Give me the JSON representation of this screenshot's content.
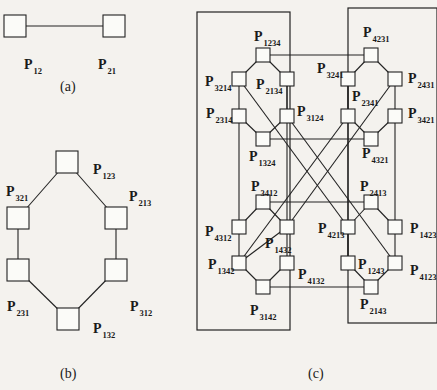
{
  "figure": {
    "panels": [
      {
        "id": "a",
        "caption": "(a)",
        "nodes": [
          {
            "id": "P12",
            "sub": "12",
            "x": 15,
            "y": 26
          },
          {
            "id": "P21",
            "sub": "21",
            "x": 114,
            "y": 26
          }
        ],
        "edges": [
          [
            "P12",
            "P21"
          ]
        ]
      },
      {
        "id": "b",
        "caption": "(b)",
        "nodes": [
          {
            "id": "P123",
            "sub": "123",
            "x": 67,
            "y": 162
          },
          {
            "id": "P321",
            "sub": "321",
            "x": 18,
            "y": 218
          },
          {
            "id": "P213",
            "sub": "213",
            "x": 116,
            "y": 218
          },
          {
            "id": "P231",
            "sub": "231",
            "x": 18,
            "y": 270
          },
          {
            "id": "P312",
            "sub": "312",
            "x": 116,
            "y": 270
          },
          {
            "id": "P132",
            "sub": "132",
            "x": 68,
            "y": 319
          }
        ],
        "edges": [
          [
            "P123",
            "P321"
          ],
          [
            "P123",
            "P213"
          ],
          [
            "P321",
            "P231"
          ],
          [
            "P213",
            "P312"
          ],
          [
            "P231",
            "P132"
          ],
          [
            "P312",
            "P132"
          ]
        ]
      },
      {
        "id": "c",
        "caption": "(c)",
        "nodes": [
          {
            "id": "P1234",
            "sub": "1234",
            "x": 263,
            "y": 55
          },
          {
            "id": "P3214",
            "sub": "3214",
            "x": 239,
            "y": 79
          },
          {
            "id": "P2134",
            "sub": "2134",
            "x": 287,
            "y": 79
          },
          {
            "id": "P2314",
            "sub": "2314",
            "x": 239,
            "y": 116
          },
          {
            "id": "P3124",
            "sub": "3124",
            "x": 287,
            "y": 116
          },
          {
            "id": "P1324",
            "sub": "1324",
            "x": 263,
            "y": 139
          },
          {
            "id": "P4231",
            "sub": "4231",
            "x": 371,
            "y": 55
          },
          {
            "id": "P3241",
            "sub": "3241",
            "x": 348,
            "y": 79
          },
          {
            "id": "P2431",
            "sub": "2431",
            "x": 395,
            "y": 79
          },
          {
            "id": "P2341",
            "sub": "2341",
            "x": 348,
            "y": 116
          },
          {
            "id": "P3421",
            "sub": "3421",
            "x": 395,
            "y": 116
          },
          {
            "id": "P4321",
            "sub": "4321",
            "x": 371,
            "y": 139
          },
          {
            "id": "P3412",
            "sub": "3412",
            "x": 263,
            "y": 202
          },
          {
            "id": "P4312",
            "sub": "4312",
            "x": 239,
            "y": 227
          },
          {
            "id": "P1432",
            "sub": "1432",
            "x": 287,
            "y": 227
          },
          {
            "id": "P1342",
            "sub": "1342",
            "x": 239,
            "y": 263
          },
          {
            "id": "P4132",
            "sub": "4132",
            "x": 287,
            "y": 263
          },
          {
            "id": "P3142",
            "sub": "3142",
            "x": 263,
            "y": 287
          },
          {
            "id": "P2413",
            "sub": "2413",
            "x": 371,
            "y": 202
          },
          {
            "id": "P4213",
            "sub": "4213",
            "x": 348,
            "y": 227
          },
          {
            "id": "P1423",
            "sub": "1423",
            "x": 395,
            "y": 227
          },
          {
            "id": "P1243",
            "sub": "1243",
            "x": 348,
            "y": 263
          },
          {
            "id": "P4123",
            "sub": "4123",
            "x": 395,
            "y": 263
          },
          {
            "id": "P2143",
            "sub": "2143",
            "x": 371,
            "y": 287
          }
        ],
        "edges": [
          [
            "P1234",
            "P3214"
          ],
          [
            "P1234",
            "P2134"
          ],
          [
            "P3214",
            "P2314"
          ],
          [
            "P2134",
            "P3124"
          ],
          [
            "P2314",
            "P1324"
          ],
          [
            "P3124",
            "P1324"
          ],
          [
            "P4231",
            "P3241"
          ],
          [
            "P4231",
            "P2431"
          ],
          [
            "P3241",
            "P2341"
          ],
          [
            "P2431",
            "P3421"
          ],
          [
            "P2341",
            "P4321"
          ],
          [
            "P3421",
            "P4321"
          ],
          [
            "P3412",
            "P4312"
          ],
          [
            "P3412",
            "P1432"
          ],
          [
            "P4312",
            "P1342"
          ],
          [
            "P1432",
            "P1342"
          ],
          [
            "P1342",
            "P3142"
          ],
          [
            "P4132",
            "P3142"
          ],
          [
            "P2413",
            "P4213"
          ],
          [
            "P2413",
            "P1423"
          ],
          [
            "P4213",
            "P1243"
          ],
          [
            "P1423",
            "P4123"
          ],
          [
            "P1243",
            "P2143"
          ],
          [
            "P4123",
            "P2143"
          ],
          [
            "P1234",
            "P4231"
          ],
          [
            "P1324",
            "P4321"
          ],
          [
            "P3412",
            "P2413"
          ],
          [
            "P3142",
            "P2143"
          ],
          [
            "P2314",
            "P4312"
          ],
          [
            "P3421",
            "P1423"
          ],
          [
            "P3214",
            "P4213"
          ],
          [
            "P3124",
            "P4123"
          ],
          [
            "P2431",
            "P1432"
          ],
          [
            "P2341",
            "P1342"
          ],
          [
            "P2134",
            "P4132"
          ],
          [
            "P3241",
            "P1243"
          ]
        ],
        "frames": [
          {
            "x": 197,
            "y": 12,
            "w": 93,
            "h": 318
          },
          {
            "x": 348,
            "y": 8,
            "w": 89,
            "h": 315
          }
        ]
      }
    ],
    "labels": [
      {
        "text": "P",
        "sub": "12",
        "x": 24,
        "y": 58
      },
      {
        "text": "P",
        "sub": "21",
        "x": 98,
        "y": 58
      },
      {
        "text": "P",
        "sub": "123",
        "x": 93,
        "y": 163
      },
      {
        "text": "P",
        "sub": "321",
        "x": 6,
        "y": 185
      },
      {
        "text": "P",
        "sub": "213",
        "x": 129,
        "y": 190
      },
      {
        "text": "P",
        "sub": "231",
        "x": 7,
        "y": 300
      },
      {
        "text": "P",
        "sub": "312",
        "x": 130,
        "y": 300
      },
      {
        "text": "P",
        "sub": "132",
        "x": 93,
        "y": 322
      },
      {
        "text": "P",
        "sub": "1234",
        "x": 254,
        "y": 30
      },
      {
        "text": "P",
        "sub": "3214",
        "x": 205,
        "y": 75
      },
      {
        "text": "P",
        "sub": "2134",
        "x": 256,
        "y": 78
      },
      {
        "text": "P",
        "sub": "2314",
        "x": 206,
        "y": 107
      },
      {
        "text": "P",
        "sub": "3124",
        "x": 297,
        "y": 105
      },
      {
        "text": "P",
        "sub": "1324",
        "x": 249,
        "y": 150
      },
      {
        "text": "P",
        "sub": "4231",
        "x": 363,
        "y": 26
      },
      {
        "text": "P",
        "sub": "3241",
        "x": 317,
        "y": 62
      },
      {
        "text": "P",
        "sub": "2431",
        "x": 408,
        "y": 72
      },
      {
        "text": "P",
        "sub": "2341",
        "x": 352,
        "y": 90
      },
      {
        "text": "P",
        "sub": "3421",
        "x": 408,
        "y": 107
      },
      {
        "text": "P",
        "sub": "4321",
        "x": 362,
        "y": 147
      },
      {
        "text": "P",
        "sub": "3412",
        "x": 251,
        "y": 180
      },
      {
        "text": "P",
        "sub": "4312",
        "x": 205,
        "y": 225
      },
      {
        "text": "P",
        "sub": "1432",
        "x": 265,
        "y": 237
      },
      {
        "text": "P",
        "sub": "1342",
        "x": 208,
        "y": 258
      },
      {
        "text": "P",
        "sub": "4132",
        "x": 298,
        "y": 268
      },
      {
        "text": "P",
        "sub": "3142",
        "x": 250,
        "y": 304
      },
      {
        "text": "P",
        "sub": "2413",
        "x": 360,
        "y": 180
      },
      {
        "text": "P",
        "sub": "4213",
        "x": 318,
        "y": 222
      },
      {
        "text": "P",
        "sub": "1423",
        "x": 410,
        "y": 222
      },
      {
        "text": "P",
        "sub": "1243",
        "x": 358,
        "y": 258
      },
      {
        "text": "P",
        "sub": "4123",
        "x": 410,
        "y": 264
      },
      {
        "text": "P",
        "sub": "2143",
        "x": 360,
        "y": 298
      }
    ],
    "captions": [
      {
        "text": "(a)",
        "x": 60,
        "y": 80
      },
      {
        "text": "(b)",
        "x": 60,
        "y": 367
      },
      {
        "text": "(c)",
        "x": 308,
        "y": 367
      }
    ],
    "node_size": 14,
    "node_size_large": 22
  }
}
